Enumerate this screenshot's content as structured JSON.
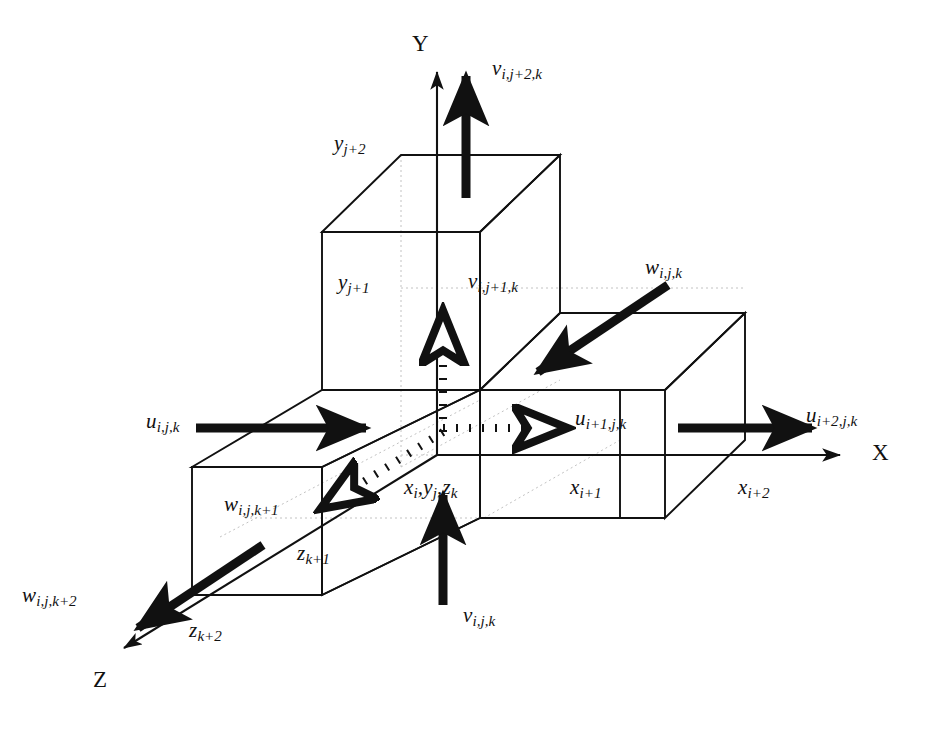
{
  "figure": {
    "type": "staggered-grid-diagram",
    "background_color": "#ffffff",
    "line_color": "#111111",
    "hidden_line_color": "#bbbbbb"
  },
  "axes": [
    {
      "name": "y-axis",
      "label": "Y",
      "direction": "up",
      "x": 412,
      "y": 32
    },
    {
      "name": "x-axis",
      "label": "X",
      "direction": "right",
      "x": 872,
      "y": 441
    },
    {
      "name": "z-axis",
      "label": "Z",
      "direction": "down-left",
      "x": 93,
      "y": 668
    }
  ],
  "velocity_labels": [
    {
      "name": "v-top",
      "base": "v",
      "sub": "i,j+2,k",
      "x": 492,
      "y": 58,
      "component": "y"
    },
    {
      "name": "v-middle",
      "base": "v",
      "sub": "i,j+1,k",
      "x": 468,
      "y": 271,
      "component": "y"
    },
    {
      "name": "v-bottom",
      "base": "v",
      "sub": "i,j,k",
      "x": 463,
      "y": 605,
      "component": "y"
    },
    {
      "name": "u-left",
      "base": "u",
      "sub": "i,j,k",
      "x": 146,
      "y": 411,
      "component": "x"
    },
    {
      "name": "u-middle",
      "base": "u",
      "sub": "i+1,j,k",
      "x": 575,
      "y": 408,
      "component": "x"
    },
    {
      "name": "u-right",
      "base": "u",
      "sub": "i+2,j,k",
      "x": 806,
      "y": 405,
      "component": "x"
    },
    {
      "name": "w-back",
      "base": "w",
      "sub": "i,j,k",
      "x": 645,
      "y": 257,
      "component": "z"
    },
    {
      "name": "w-middle",
      "base": "w",
      "sub": "i,j,k+1",
      "x": 224,
      "y": 494,
      "component": "z"
    },
    {
      "name": "w-front",
      "base": "w",
      "sub": "i,j,k+2",
      "x": 22,
      "y": 585,
      "component": "z"
    }
  ],
  "coordinate_labels": [
    {
      "name": "y-j-plus-2",
      "base": "y",
      "sub": "j+2",
      "x": 334,
      "y": 133
    },
    {
      "name": "y-j-plus-1",
      "base": "y",
      "sub": "j+1",
      "x": 338,
      "y": 272
    },
    {
      "name": "cell-center",
      "base": "x",
      "sub": "i,yj,zk",
      "text": "xi,yj,zk",
      "x": 404,
      "y": 477
    },
    {
      "name": "x-i-plus-1",
      "base": "x",
      "sub": "i+1",
      "x": 570,
      "y": 477
    },
    {
      "name": "x-i-plus-2",
      "base": "x",
      "sub": "i+2",
      "x": 738,
      "y": 477
    },
    {
      "name": "z-k-plus-1",
      "base": "z",
      "sub": "k+1",
      "x": 297,
      "y": 543
    },
    {
      "name": "z-k-plus-2",
      "base": "z",
      "sub": "k+2",
      "x": 189,
      "y": 620
    }
  ]
}
